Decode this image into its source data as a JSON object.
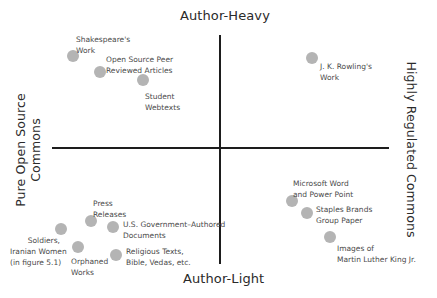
{
  "diagram": {
    "type": "quadrant",
    "axes": {
      "top": "Author-Heavy",
      "bottom": "Author-Light",
      "left": "Pure Open Source\nCommons",
      "left_line1": "Pure Open Source",
      "left_line2": "Commons",
      "right": "Highly Regulated Commons"
    },
    "colors": {
      "axis": "#1d1d1d",
      "dot": "#b4b4b4",
      "label_text": "#4a4a4a",
      "axis_text": "#2a2a2a"
    },
    "items": [
      {
        "id": "shakespeare",
        "label": "Shakespeare's\nWork",
        "quadrant": "top-left"
      },
      {
        "id": "open-source-peer",
        "label": "Open Source Peer\nReviewed Articles",
        "quadrant": "top-left"
      },
      {
        "id": "student-webtexts",
        "label": "Student\nWebtexts",
        "quadrant": "top-left"
      },
      {
        "id": "jk-rowling",
        "label": "J. K. Rowling's\nWork",
        "quadrant": "top-right"
      },
      {
        "id": "press-releases",
        "label": "Press\nReleases",
        "quadrant": "bottom-left"
      },
      {
        "id": "us-government",
        "label": "U.S. Government–Authored\nDocuments",
        "quadrant": "bottom-left"
      },
      {
        "id": "soldiers",
        "label": "Soldiers,\nIranian Women\n(in figure 5.1)",
        "quadrant": "bottom-left"
      },
      {
        "id": "orphaned-works",
        "label": "Orphaned\nWorks",
        "quadrant": "bottom-left"
      },
      {
        "id": "religious-texts",
        "label": "Religious Texts,\nBible, Vedas, etc.",
        "quadrant": "bottom-left"
      },
      {
        "id": "microsoft",
        "label": "Microsoft Word\nand Power Point",
        "quadrant": "bottom-right"
      },
      {
        "id": "staples",
        "label": "Staples Brands\nGroup Paper",
        "quadrant": "bottom-right"
      },
      {
        "id": "mlk",
        "label": "Images of\nMartin Luther King Jr.",
        "quadrant": "bottom-right"
      }
    ]
  }
}
